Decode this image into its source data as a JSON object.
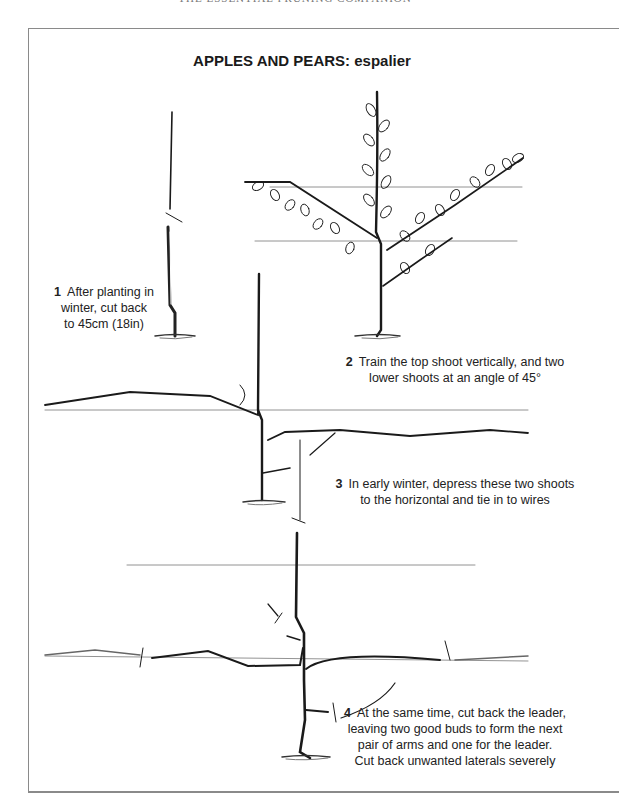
{
  "running_head": "THE ESSENTIAL PRUNING COMPANION",
  "title": "APPLES AND PEARS: espalier",
  "steps": [
    {
      "number": "1",
      "lines": [
        "After planting in",
        "winter, cut back",
        "to 45cm (18in)"
      ]
    },
    {
      "number": "2",
      "lines": [
        "Train the top shoot vertically, and two",
        "lower shoots at an angle of 45°"
      ]
    },
    {
      "number": "3",
      "lines": [
        "In early winter, depress these two shoots",
        "to the horizontal and tie in to wires"
      ]
    },
    {
      "number": "4",
      "lines": [
        "At the same time, cut back the leader,",
        "leaving two good buds to form the next",
        "pair of arms and one for the leader.",
        "Cut back unwanted laterals severely"
      ]
    }
  ],
  "illustrations": [
    {
      "stage": 1,
      "subject": "maiden whip cut back"
    },
    {
      "stage": 2,
      "subject": "leader vertical with two shoots at 45 degrees, leafy"
    },
    {
      "stage": 3,
      "subject": "arms lowered to horizontal wire"
    },
    {
      "stage": 4,
      "subject": "leader cut back above next wire, laterals pruned"
    }
  ],
  "colors": {
    "ink": "#1a1a1a",
    "wire": "#777777",
    "frame": "#8a8a8a"
  }
}
